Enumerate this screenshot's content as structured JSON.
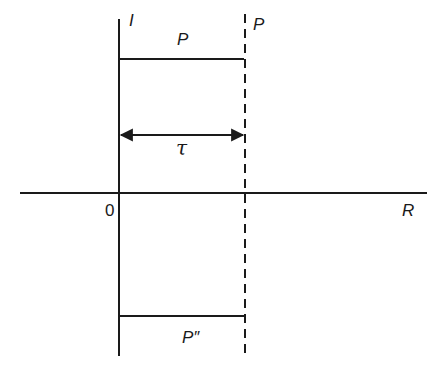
{
  "figure": {
    "axes": {
      "vertical_label": "I",
      "horizontal_label": "R",
      "origin_label": "0"
    },
    "top_segment_label": "P",
    "dashed_line_label": "P",
    "interval_label": "τ",
    "bottom_segment_label": "P″"
  },
  "colors": {
    "ink": "#1a1a1a",
    "background": "#ffffff"
  }
}
